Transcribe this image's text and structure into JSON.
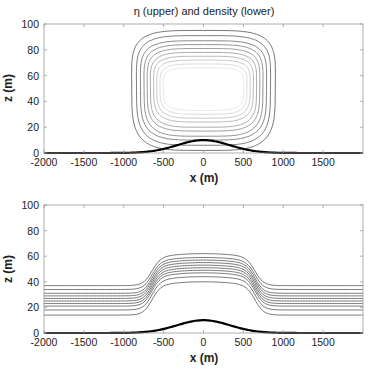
{
  "chart_data": [
    {
      "type": "contour",
      "panel": "upper",
      "title": "η (upper) and density (lower)",
      "xlabel": "x (m)",
      "ylabel": "z (m)",
      "xlim": [
        -2000,
        2000
      ],
      "ylim": [
        0,
        100
      ],
      "xticks": [
        -2000,
        -1500,
        -1000,
        -500,
        0,
        500,
        1000,
        1500
      ],
      "yticks": [
        0,
        20,
        40,
        60,
        80,
        100
      ],
      "grid": false,
      "description": "Closed contour loops of η centered near x=0, z≈48; outer loops dark gray, inner loops progressively lighter",
      "contours": [
        {
          "x_half_width": 900,
          "z_top": 95,
          "z_bottom": 2,
          "color": "#555555"
        },
        {
          "x_half_width": 840,
          "z_top": 91,
          "z_bottom": 6,
          "color": "#5f5f5f"
        },
        {
          "x_half_width": 790,
          "z_top": 87,
          "z_bottom": 10,
          "color": "#6a6a6a"
        },
        {
          "x_half_width": 745,
          "z_top": 84,
          "z_bottom": 13,
          "color": "#777777"
        },
        {
          "x_half_width": 705,
          "z_top": 81,
          "z_bottom": 17,
          "color": "#858585"
        },
        {
          "x_half_width": 665,
          "z_top": 78,
          "z_bottom": 20,
          "color": "#959595"
        },
        {
          "x_half_width": 625,
          "z_top": 75,
          "z_bottom": 24,
          "color": "#a8a8a8"
        },
        {
          "x_half_width": 585,
          "z_top": 72,
          "z_bottom": 27,
          "color": "#bdbdbd"
        },
        {
          "x_half_width": 545,
          "z_top": 69,
          "z_bottom": 30,
          "color": "#d2d2d2"
        },
        {
          "x_half_width": 505,
          "z_top": 66,
          "z_bottom": 33,
          "color": "#e3e3e3"
        }
      ],
      "topography": {
        "shape": "gaussian",
        "peak_z": 10,
        "center_x": 0,
        "sigma_m": 330
      }
    },
    {
      "type": "contour",
      "panel": "lower",
      "title": "",
      "xlabel": "x (m)",
      "ylabel": "z (m)",
      "xlim": [
        -2000,
        2000
      ],
      "ylim": [
        0,
        100
      ],
      "xticks": [
        -2000,
        -1500,
        -1000,
        -500,
        0,
        500,
        1000,
        1500
      ],
      "yticks": [
        0,
        20,
        40,
        60,
        80,
        100
      ],
      "grid": false,
      "description": "Density isopycnals raised over the hill, flat far-field",
      "isopycnals": [
        {
          "z_far": 37,
          "z_center": 62
        },
        {
          "z_far": 34,
          "z_center": 59
        },
        {
          "z_far": 31,
          "z_center": 57
        },
        {
          "z_far": 29,
          "z_center": 55
        },
        {
          "z_far": 27,
          "z_center": 53
        },
        {
          "z_far": 25,
          "z_center": 51
        },
        {
          "z_far": 23,
          "z_center": 49
        },
        {
          "z_far": 21,
          "z_center": 47
        },
        {
          "z_far": 18,
          "z_center": 44
        },
        {
          "z_far": 14,
          "z_center": 40
        }
      ],
      "line_color": "#555555",
      "topography": {
        "shape": "gaussian",
        "peak_z": 10,
        "center_x": 0,
        "sigma_m": 330
      }
    }
  ],
  "upper": {
    "title": "η (upper) and density (lower)",
    "xlabel": "x (m)",
    "ylabel": "z (m)",
    "xtick_labels": [
      "-2000",
      "-1500",
      "-1000",
      "-500",
      "0",
      "500",
      "1000",
      "1500"
    ],
    "ytick_labels": [
      "0",
      "20",
      "40",
      "60",
      "80",
      "100"
    ]
  },
  "lower": {
    "xlabel": "x (m)",
    "ylabel": "z (m)",
    "xtick_labels": [
      "-2000",
      "-1500",
      "-1000",
      "-500",
      "0",
      "500",
      "1000",
      "1500"
    ],
    "ytick_labels": [
      "0",
      "20",
      "40",
      "60",
      "80",
      "100"
    ]
  }
}
